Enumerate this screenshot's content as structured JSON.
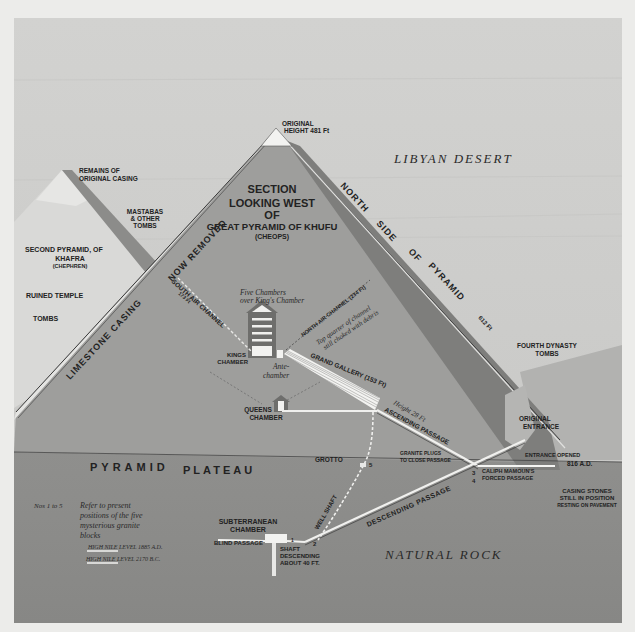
{
  "diagram": {
    "title": {
      "line1": "SECTION",
      "line2": "LOOKING WEST",
      "line3": "OF",
      "line4": "GREAT PYRAMID OF KHUFU",
      "line5": "(CHEOPS)"
    },
    "regions": {
      "desert": "LIBYAN DESERT",
      "plateau_left": "PYRAMID",
      "plateau_right": "PLATEAU",
      "rock": "NATURAL ROCK"
    },
    "apex": {
      "line1": "ORIGINAL",
      "line2": "HEIGHT 481 Ft"
    },
    "edges": {
      "left": "LIMESTONE CASING",
      "left_upper": "NOW REMOVED",
      "right_1": "NORTH",
      "right_2": "SIDE",
      "right_3": "OF",
      "right_4": "PYRAMID",
      "right_length": "612 Ft"
    },
    "left_side": {
      "casing_1": "REMAINS OF",
      "casing_2": "ORIGINAL CASING",
      "mastabas_1": "MASTABAS",
      "mastabas_2": "& OTHER",
      "mastabas_3": "TOMBS",
      "second_1": "SECOND PYRAMID, OF",
      "second_2": "KHAFRA",
      "second_3": "(CHEPHREN)",
      "temple": "RUINED TEMPLE",
      "tombs": "TOMBS"
    },
    "right_side": {
      "dynasty_1": "FOURTH DYNASTY",
      "dynasty_2": "TOMBS",
      "entrance_1": "ORIGINAL",
      "entrance_2": "ENTRANCE",
      "opened_1": "ENTRANCE OPENED",
      "opened_2": "816 A.D.",
      "casing_1": "CASING STONES",
      "casing_2": "STILL IN POSITION",
      "casing_3": "RESTING ON PAVEMENT"
    },
    "interior": {
      "south_air": "SOUTH AIR CHANNEL",
      "south_air_len": "173 Ft",
      "five_1": "Five Chambers",
      "five_2": "over King's Chamber",
      "north_air": "NORTH AIR CHANNEL (234 Ft)",
      "choked_1": "Top quarter of channel",
      "choked_2": "still choked with debris",
      "kings_1": "KINGS",
      "kings_2": "CHAMBER",
      "ante_1": "Ante-",
      "ante_2": "chamber",
      "gallery": "GRAND GALLERY (153 Ft)",
      "gallery_height": "Height 28 Ft",
      "queens_1": "QUEENS",
      "queens_2": "CHAMBER",
      "ascending": "ASCENDING PASSAGE",
      "grotto": "GROTTO",
      "granite_1": "GRANITE PLUGS",
      "granite_2": "TO CLOSE PASSAGE",
      "mamoun_1": "CALIPH MAMOUN'S",
      "mamoun_2": "FORCED PASSAGE",
      "descending": "DESCENDING PASSAGE",
      "well": "WELL SHAFT",
      "sub_1": "SUBTERRANEAN",
      "sub_2": "CHAMBER",
      "blind": "BLIND PASSAGE",
      "shaft_1": "SHAFT",
      "shaft_2": "DESCENDING",
      "shaft_3": "ABOUT 40 FT.",
      "n1": "1",
      "n2": "2",
      "n3": "3",
      "n4": "4",
      "n5": "5"
    },
    "legend": {
      "nos": "Nos 1 to 5",
      "desc_1": "Refer to present",
      "desc_2": "positions of the five",
      "desc_3": "mysterious granite",
      "desc_4": "blocks",
      "nile_1": "HIGH NILE LEVEL 1885 A.D.",
      "nile_2": "HIGH NILE LEVEL 2170 B.C."
    }
  },
  "colors": {
    "paper": "#ececea",
    "sky": "#cfcfcd",
    "pyramid": "#9d9d9b",
    "shadow": "#7c7c7a",
    "second_pyramid": "#d8d8d6",
    "ground": "#8e8e8c",
    "rock": "#8a8a88"
  }
}
